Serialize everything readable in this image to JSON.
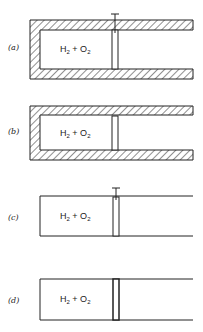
{
  "panels": [
    {
      "label": "(a)",
      "gas": {
        "main1": "H",
        "sub1": "2",
        "plus": " + ",
        "main2": "O",
        "sub2": "2"
      },
      "insulated_walls": true,
      "piston_pinned": true
    },
    {
      "label": "(b)",
      "gas": {
        "main1": "H",
        "sub1": "2",
        "plus": " + ",
        "main2": "O",
        "sub2": "2"
      },
      "insulated_walls": true,
      "piston_pinned": false
    },
    {
      "label": "(c)",
      "gas": {
        "main1": "H",
        "sub1": "2",
        "plus": " + ",
        "main2": "O",
        "sub2": "2"
      },
      "insulated_walls": false,
      "piston_pinned": true
    },
    {
      "label": "(d)",
      "gas": {
        "main1": "H",
        "sub1": "2",
        "plus": " + ",
        "main2": "O",
        "sub2": "2"
      },
      "insulated_walls": false,
      "piston_pinned": false
    }
  ],
  "colors": {
    "ink": "#222222",
    "background": "#ffffff"
  }
}
